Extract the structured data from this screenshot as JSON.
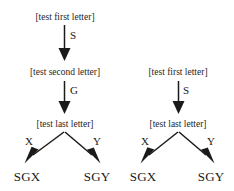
{
  "diagram": {
    "background_color": "#ffffff",
    "ink_color": "#1a1a1a",
    "trees": [
      {
        "id": "left-tree",
        "nodes": [
          {
            "id": "l1",
            "label": "[test first letter]"
          },
          {
            "id": "l2",
            "label": "[test second letter]"
          },
          {
            "id": "l3",
            "label": "[test last letter]"
          }
        ],
        "leaves": [
          {
            "id": "l-leaf-x",
            "label": "SGX"
          },
          {
            "id": "l-leaf-y",
            "label": "SGY"
          }
        ],
        "edges": [
          {
            "from": "l1",
            "to": "l2",
            "label": "S"
          },
          {
            "from": "l2",
            "to": "l3",
            "label": "G"
          },
          {
            "from": "l3",
            "to": "l-leaf-x",
            "label": "X"
          },
          {
            "from": "l3",
            "to": "l-leaf-y",
            "label": "Y"
          }
        ]
      },
      {
        "id": "right-tree",
        "nodes": [
          {
            "id": "r1",
            "label": "[test first letter]"
          },
          {
            "id": "r2",
            "label": "[test last letter]"
          }
        ],
        "leaves": [
          {
            "id": "r-leaf-x",
            "label": "SGX"
          },
          {
            "id": "r-leaf-y",
            "label": "SGY"
          }
        ],
        "edges": [
          {
            "from": "r1",
            "to": "r2",
            "label": "S"
          },
          {
            "from": "r2",
            "to": "r-leaf-x",
            "label": "X"
          },
          {
            "from": "r2",
            "to": "r-leaf-y",
            "label": "Y"
          }
        ]
      }
    ]
  }
}
